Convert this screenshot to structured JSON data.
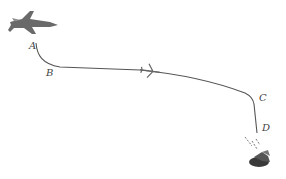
{
  "diagram": {
    "points": [
      {
        "label": "A",
        "x": 29,
        "y": 43
      },
      {
        "label": "B",
        "x": 46,
        "y": 69
      },
      {
        "label": "C",
        "x": 259,
        "y": 94
      },
      {
        "label": "D",
        "x": 262,
        "y": 125
      }
    ],
    "icons": [
      "fighter-jet-icon",
      "small-plane-icon",
      "impact-crater-icon"
    ],
    "colors": {
      "path": "#555555",
      "jet": "#6a6a6a",
      "crater": "#3a3a3a"
    }
  }
}
